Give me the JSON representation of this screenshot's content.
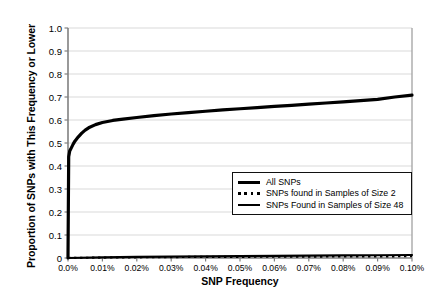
{
  "chart_data": {
    "type": "line",
    "title": "",
    "xlabel": "SNP Frequency",
    "ylabel": "Proportion of SNPs with This Frequency or Lower",
    "xlim": [
      0,
      0.1
    ],
    "ylim": [
      0,
      1.0
    ],
    "grid": "horizontal",
    "legend_position": "inside-lower-right",
    "xtick_labels": [
      "0.0%",
      "0.01%",
      "0.02%",
      "0.03%",
      "0.04%",
      "0.05%",
      "0.06%",
      "0.07%",
      "0.08%",
      "0.09%",
      "0.10%"
    ],
    "xtick_values": [
      0,
      0.01,
      0.02,
      0.03,
      0.04,
      0.05,
      0.06,
      0.07,
      0.08,
      0.09,
      0.1
    ],
    "ytick_labels": [
      "0",
      "0.1",
      "0.2",
      "0.3",
      "0.4",
      "0.5",
      "0.6",
      "0.7",
      "0.8",
      "0.9",
      "1.0"
    ],
    "ytick_values": [
      0,
      0.1,
      0.2,
      0.3,
      0.4,
      0.5,
      0.6,
      0.7,
      0.8,
      0.9,
      1.0
    ],
    "series": [
      {
        "name": "All SNPs",
        "style": "solid-thick",
        "color": "#000000",
        "x": [
          0,
          0.0002,
          0.0005,
          0.001,
          0.0015,
          0.002,
          0.003,
          0.004,
          0.005,
          0.006,
          0.008,
          0.01,
          0.013,
          0.016,
          0.02,
          0.025,
          0.03,
          0.035,
          0.04,
          0.045,
          0.05,
          0.055,
          0.06,
          0.065,
          0.07,
          0.075,
          0.08,
          0.085,
          0.09,
          0.095,
          0.1
        ],
        "y": [
          0,
          0.44,
          0.465,
          0.48,
          0.495,
          0.508,
          0.527,
          0.543,
          0.556,
          0.566,
          0.58,
          0.589,
          0.598,
          0.604,
          0.611,
          0.619,
          0.626,
          0.632,
          0.638,
          0.644,
          0.649,
          0.654,
          0.659,
          0.664,
          0.669,
          0.674,
          0.679,
          0.684,
          0.69,
          0.7,
          0.708
        ]
      },
      {
        "name": "SNPs found in Samples of Size 2",
        "style": "dotted",
        "color": "#000000",
        "x": [
          0,
          0.01,
          0.02,
          0.03,
          0.04,
          0.05,
          0.06,
          0.07,
          0.08,
          0.09,
          0.1
        ],
        "y": [
          0,
          0.002,
          0.003,
          0.004,
          0.005,
          0.005,
          0.006,
          0.006,
          0.007,
          0.007,
          0.008
        ]
      },
      {
        "name": "SNPs Found in Samples of Size 48",
        "style": "solid-thin",
        "color": "#000000",
        "x": [
          0,
          0.01,
          0.02,
          0.03,
          0.04,
          0.05,
          0.06,
          0.07,
          0.08,
          0.09,
          0.1
        ],
        "y": [
          0,
          0.003,
          0.005,
          0.006,
          0.007,
          0.008,
          0.009,
          0.01,
          0.011,
          0.012,
          0.013
        ]
      }
    ]
  }
}
